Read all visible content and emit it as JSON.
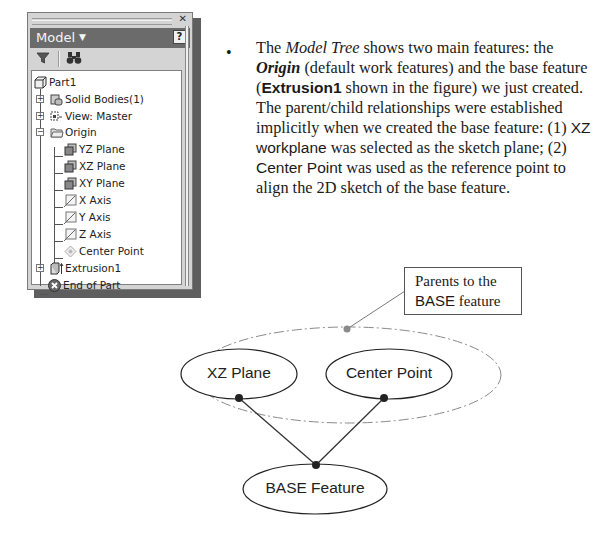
{
  "model_panel": {
    "title": "Model",
    "close_icon": "close-icon",
    "help_label": "?",
    "toolbar": [
      {
        "name": "filter-icon",
        "glyph": "▼"
      },
      {
        "name": "find-binoculars-icon",
        "glyph": "⚇"
      }
    ],
    "tree": [
      {
        "label": "Part1",
        "level": 0,
        "icon": "part-icon",
        "expander": null
      },
      {
        "label": "Solid Bodies(1)",
        "level": 1,
        "icon": "solid-bodies-icon",
        "expander": "+"
      },
      {
        "label": "View: Master",
        "level": 1,
        "icon": "view-icon",
        "expander": "+"
      },
      {
        "label": "Origin",
        "level": 1,
        "icon": "folder-icon",
        "expander": "-"
      },
      {
        "label": "YZ Plane",
        "level": 2,
        "icon": "work-plane-icon",
        "expander": null
      },
      {
        "label": "XZ Plane",
        "level": 2,
        "icon": "work-plane-icon",
        "expander": null
      },
      {
        "label": "XY Plane",
        "level": 2,
        "icon": "work-plane-icon",
        "expander": null
      },
      {
        "label": "X Axis",
        "level": 2,
        "icon": "work-axis-icon",
        "expander": null
      },
      {
        "label": "Y Axis",
        "level": 2,
        "icon": "work-axis-icon",
        "expander": null
      },
      {
        "label": "Z Axis",
        "level": 2,
        "icon": "work-axis-icon",
        "expander": null
      },
      {
        "label": "Center Point",
        "level": 2,
        "icon": "work-point-icon",
        "expander": null
      },
      {
        "label": "Extrusion1",
        "level": 1,
        "icon": "extrusion-icon",
        "expander": "+"
      },
      {
        "label": "End of Part",
        "level": 1,
        "icon": "end-of-part-icon",
        "expander": null
      }
    ]
  },
  "bullet": {
    "t1": "The ",
    "model_tree": "Model Tree",
    "t2": " shows two main features: the ",
    "origin": "Origin",
    "t3": " (default work features) and the base feature (",
    "extrusion1": "Extrusion1",
    "t4": " shown in the figure) we just created. The parent/child relationships were established implicitly when we created the base feature: (1) ",
    "xz_workplane": "XZ workplane",
    "t5": " was selected as the sketch plane; (2) ",
    "center_point": "Center Point",
    "t6": " was used as the reference point to align the 2D sketch of the base feature."
  },
  "diagram": {
    "callout_line1": "Parents to the",
    "callout_base": "BASE",
    "callout_feature": " feature",
    "node_xz": "XZ Plane",
    "node_center": "Center Point",
    "node_base": "BASE Feature"
  }
}
